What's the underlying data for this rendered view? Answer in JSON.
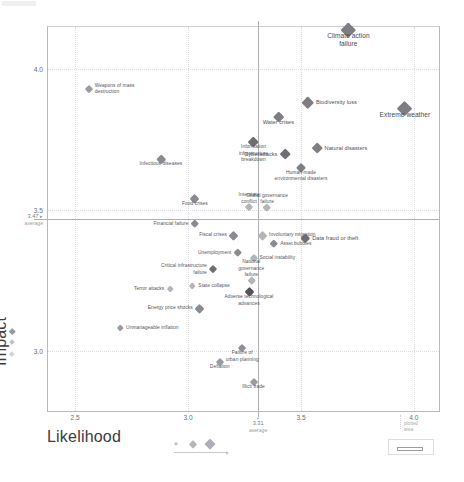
{
  "chart_data": {
    "type": "scatter",
    "title": "",
    "xlabel": "Likelihood",
    "ylabel": "Impact",
    "xlim": [
      2.38,
      4.12
    ],
    "ylim": [
      2.78,
      4.15
    ],
    "xticks": [
      "2.5",
      "3.0",
      "3.5",
      "4.0"
    ],
    "xtick_values": [
      2.5,
      3.0,
      3.5,
      4.0
    ],
    "yticks": [
      "4.0",
      "3.5",
      "3.0"
    ],
    "ytick_values": [
      4.0,
      3.5,
      3.0
    ],
    "grid": "dotted",
    "legend_position": "bottom-left",
    "averages": {
      "x_value": 3.31,
      "x_label": "3.31",
      "x_sub": "average",
      "y_value": 3.47,
      "y_label": "3.47",
      "y_sub": "average",
      "marker": "▸"
    },
    "points": [
      {
        "name": "Climate action failure",
        "x": 3.71,
        "y": 4.14,
        "size": 15.5,
        "color": "#7d7d83",
        "label_pos": "c-below",
        "label_style": "big",
        "label_text": "Climate action\nfailure"
      },
      {
        "name": "Extreme weather",
        "x": 3.96,
        "y": 3.86,
        "size": 15.0,
        "color": "#7d7d83",
        "label_pos": "c-below",
        "label_style": "big",
        "label_text": "Extreme weather"
      },
      {
        "name": "Biodiversity loss",
        "x": 3.53,
        "y": 3.88,
        "size": 12.5,
        "color": "#7d7d83",
        "label_pos": "r",
        "label_style": "mid",
        "label_text": "Biodiversity loss"
      },
      {
        "name": "Water crises",
        "x": 3.4,
        "y": 3.83,
        "size": 10.5,
        "color": "#7d7d83",
        "label_pos": "c-below",
        "label_style": "mid",
        "label_text": "Water crises"
      },
      {
        "name": "Natural disasters",
        "x": 3.57,
        "y": 3.72,
        "size": 11.5,
        "color": "#7d7d83",
        "label_pos": "r",
        "label_style": "mid",
        "label_text": "Natural disasters"
      },
      {
        "name": "Cyberattacks",
        "x": 3.43,
        "y": 3.7,
        "size": 11.5,
        "color": "#6e6e74",
        "label_pos": "l",
        "label_style": "mid",
        "label_text": "Cyberattacks"
      },
      {
        "name": "Human-made environmental disasters",
        "x": 3.5,
        "y": 3.65,
        "size": 10.0,
        "color": "#7d7d83",
        "label_pos": "c-below",
        "label_style": "",
        "label_text": "Human-made\nenvironmental disasters"
      },
      {
        "name": "Information infrastructure breakdown",
        "x": 3.29,
        "y": 3.74,
        "size": 11.5,
        "color": "#6e6e74",
        "label_pos": "c-below",
        "label_style": "",
        "label_text": "Information\ninfrastructure\nbreakdown"
      },
      {
        "name": "Weapons of mass destruction",
        "x": 2.56,
        "y": 3.93,
        "size": 8.0,
        "color": "#9a9aa0",
        "label_pos": "r",
        "label_style": "",
        "label_text": "Weapons of mass\ndestruction"
      },
      {
        "name": "Infectious diseases",
        "x": 2.88,
        "y": 3.68,
        "size": 9.5,
        "color": "#8a8a90",
        "label_pos": "c-below",
        "label_style": "",
        "label_text": "Infectious diseases"
      },
      {
        "name": "Food crises",
        "x": 3.03,
        "y": 3.54,
        "size": 9.0,
        "color": "#8a8a90",
        "label_pos": "c-below",
        "label_style": "",
        "label_text": "Food crises"
      },
      {
        "name": "Interstate conflict",
        "x": 3.27,
        "y": 3.51,
        "size": 8.0,
        "color": "#b4b4b9",
        "label_pos": "c-above",
        "label_style": "",
        "label_text": "Interstate\nconflict"
      },
      {
        "name": "Global governance failure",
        "x": 3.35,
        "y": 3.51,
        "size": 8.5,
        "color": "#b4b4b9",
        "label_pos": "c-above",
        "label_style": "",
        "label_text": "Global governance\nfailure"
      },
      {
        "name": "Financial failure",
        "x": 3.03,
        "y": 3.45,
        "size": 8.5,
        "color": "#8a8a90",
        "label_pos": "l",
        "label_style": "",
        "label_text": "Financial failure"
      },
      {
        "name": "Fiscal crises",
        "x": 3.2,
        "y": 3.41,
        "size": 9.0,
        "color": "#8a8a90",
        "label_pos": "l",
        "label_style": "",
        "label_text": "Fiscal crises"
      },
      {
        "name": "Involuntary migration",
        "x": 3.33,
        "y": 3.41,
        "size": 9.0,
        "color": "#b4b4b9",
        "label_pos": "r",
        "label_style": "",
        "label_text": "Involuntary migration"
      },
      {
        "name": "Data fraud or theft",
        "x": 3.52,
        "y": 3.4,
        "size": 9.5,
        "color": "#6e6e74",
        "label_pos": "r",
        "label_style": "mid",
        "label_text": "Data fraud or theft"
      },
      {
        "name": "Asset bubbles",
        "x": 3.38,
        "y": 3.38,
        "size": 8.5,
        "color": "#8a8a90",
        "label_pos": "r",
        "label_style": "",
        "label_text": "Asset bubbles"
      },
      {
        "name": "Unemployment",
        "x": 3.22,
        "y": 3.35,
        "size": 8.5,
        "color": "#8a8a90",
        "label_pos": "l",
        "label_style": "",
        "label_text": "Unemployment"
      },
      {
        "name": "Social instability",
        "x": 3.29,
        "y": 3.33,
        "size": 8.0,
        "color": "#b4b4b9",
        "label_pos": "r",
        "label_style": "",
        "label_text": "Social instability"
      },
      {
        "name": "Critical infrastructure failure",
        "x": 3.11,
        "y": 3.29,
        "size": 8.0,
        "color": "#6e6e74",
        "label_pos": "l",
        "label_style": "",
        "label_text": "Critical infrastructure\nfailure"
      },
      {
        "name": "National governance failure",
        "x": 3.28,
        "y": 3.25,
        "size": 8.5,
        "color": "#b4b4b9",
        "label_pos": "c-above",
        "label_style": "",
        "label_text": "National\ngovernance\nfailure"
      },
      {
        "name": "State collapse",
        "x": 3.02,
        "y": 3.23,
        "size": 7.5,
        "color": "#b4b4b9",
        "label_pos": "r",
        "label_style": "",
        "label_text": "State collapse"
      },
      {
        "name": "Adverse technological advances",
        "x": 3.27,
        "y": 3.21,
        "size": 9.0,
        "color": "#55555b",
        "label_pos": "c-below",
        "label_style": "",
        "label_text": "Adverse technological\nadvances"
      },
      {
        "name": "Terror attacks",
        "x": 2.92,
        "y": 3.22,
        "size": 7.5,
        "color": "#b4b4b9",
        "label_pos": "l",
        "label_style": "",
        "label_text": "Terror attacks"
      },
      {
        "name": "Energy price shocks",
        "x": 3.05,
        "y": 3.15,
        "size": 9.0,
        "color": "#8a8a90",
        "label_pos": "l",
        "label_style": "",
        "label_text": "Energy price shocks"
      },
      {
        "name": "Unmanageable inflation",
        "x": 2.7,
        "y": 3.08,
        "size": 7.5,
        "color": "#9a9aa0",
        "label_pos": "r",
        "label_style": "",
        "label_text": "Unmanageable inflation"
      },
      {
        "name": "Failure of urban planning",
        "x": 3.24,
        "y": 3.01,
        "size": 8.0,
        "color": "#8f8f95",
        "label_pos": "c-below",
        "label_style": "",
        "label_text": "Failure of\nurban planning"
      },
      {
        "name": "Deflation",
        "x": 3.14,
        "y": 2.96,
        "size": 8.0,
        "color": "#9a9aa0",
        "label_pos": "c-below",
        "label_style": "",
        "label_text": "Deflation"
      },
      {
        "name": "Illicit trade",
        "x": 3.29,
        "y": 2.89,
        "size": 8.0,
        "color": "#9a9aa0",
        "label_pos": "c-below",
        "label_style": "",
        "label_text": "Illicit trade"
      }
    ],
    "size_legend": {
      "title": "Likelihood",
      "items": [
        {
          "size": 4.5,
          "color": "#c2c2c7"
        },
        {
          "size": 7.5,
          "color": "#b6b6bb"
        },
        {
          "size": 10.5,
          "color": "#aeaeb4"
        }
      ]
    },
    "category_legend": [
      {
        "color": "#9a9aa0",
        "size": 4.5
      },
      {
        "color": "#c0c0c5",
        "size": 4.0
      },
      {
        "color": "#d3d3d8",
        "size": 3.5
      }
    ],
    "callout": {
      "line1": "plotted",
      "line2": "area"
    },
    "footnote": ""
  },
  "axes": {
    "impact_label": "Impact",
    "likelihood_label": "Likelihood"
  }
}
